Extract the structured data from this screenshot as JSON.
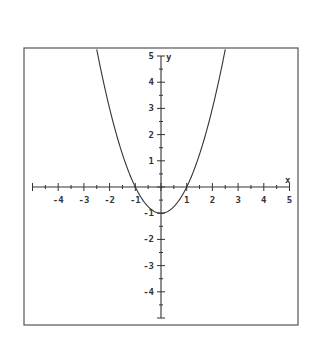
{
  "chart_data": {
    "type": "line",
    "title": "",
    "function": "y = x^2 - 1",
    "xlabel": "x",
    "ylabel": "y",
    "xlim": [
      -5,
      5
    ],
    "ylim": [
      -5,
      5
    ],
    "grid": false,
    "legend": null,
    "x_ticks": [
      -4,
      -3,
      -2,
      -1,
      1,
      2,
      3,
      4,
      5
    ],
    "y_ticks": [
      5,
      4,
      3,
      2,
      1,
      -1,
      -2,
      -3,
      -4
    ],
    "x_tick_labels": [
      "-4",
      "-3",
      "-2",
      "-1",
      "1",
      "2",
      "3",
      "4",
      "5"
    ],
    "y_tick_labels": [
      "5",
      "4",
      "3",
      "2",
      "1",
      "-1",
      "-2",
      "-3",
      "-4"
    ],
    "minor_tick_step": 0.5,
    "series": [
      {
        "name": "y = x^2 - 1",
        "x": [
          -2.5,
          -2,
          -1.5,
          -1,
          -0.5,
          0,
          0.5,
          1,
          1.5,
          2,
          2.5
        ],
        "y": [
          5.25,
          3,
          1.25,
          0,
          -0.75,
          -1,
          -0.75,
          0,
          1.25,
          3,
          5.25
        ]
      }
    ],
    "annotations": {
      "vertex": [
        0,
        -1
      ],
      "x_intercepts": [
        -1,
        1
      ]
    }
  },
  "colors": {
    "background": "#ffffff",
    "ink": "#333333",
    "border": "#555555"
  }
}
